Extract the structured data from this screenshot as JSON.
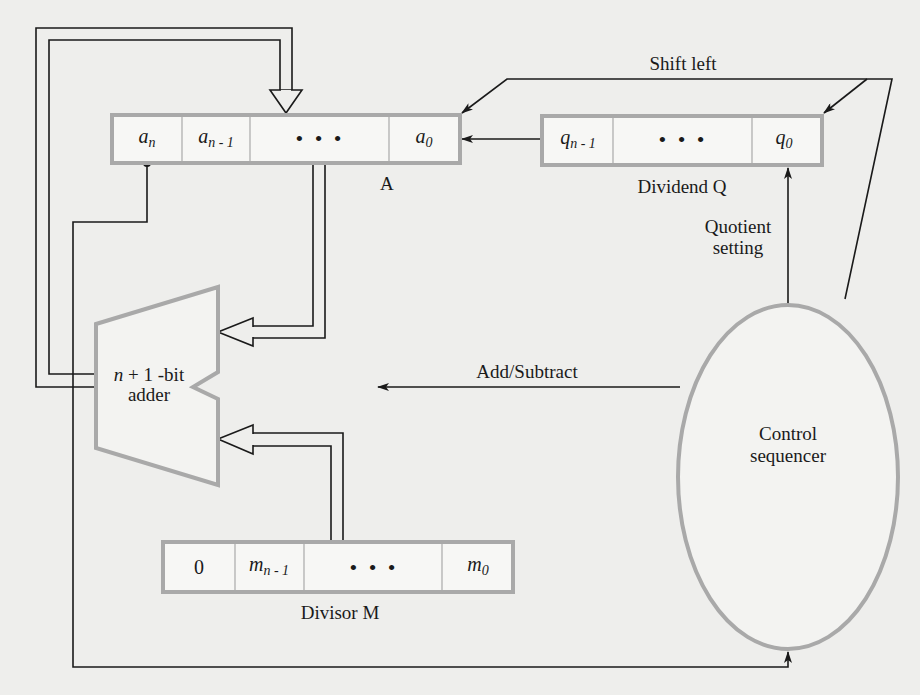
{
  "figure": {
    "type": "block-diagram"
  },
  "registers": {
    "A": {
      "label": "A",
      "cells": [
        {
          "base": "a",
          "sub": "n"
        },
        {
          "base": "a",
          "sub": "n - 1"
        },
        {
          "base": "• • •",
          "sub": ""
        },
        {
          "base": "a",
          "sub": "0"
        }
      ]
    },
    "Q": {
      "label": "Dividend Q",
      "cells": [
        {
          "base": "q",
          "sub": "n - 1"
        },
        {
          "base": "• • •",
          "sub": ""
        },
        {
          "base": "q",
          "sub": "0"
        }
      ]
    },
    "M": {
      "label": "Divisor M",
      "cells": [
        {
          "base": "0",
          "sub": ""
        },
        {
          "base": "m",
          "sub": "n - 1"
        },
        {
          "base": "• • •",
          "sub": ""
        },
        {
          "base": "m",
          "sub": "0"
        }
      ]
    }
  },
  "adder": {
    "line1": "n + 1 -bit",
    "line1_var": "n",
    "line1_rest": " + 1 -bit",
    "line2": "adder"
  },
  "control": {
    "line1": "Control",
    "line2": "sequencer"
  },
  "signals": {
    "shift_left": "Shift left",
    "add_subtract": "Add/Subtract",
    "quotient_setting_line1": "Quotient",
    "quotient_setting_line2": "setting"
  },
  "colors": {
    "background": "#eeeeec",
    "line": "#1a1a1a",
    "register_border": "#a9a9a9"
  }
}
